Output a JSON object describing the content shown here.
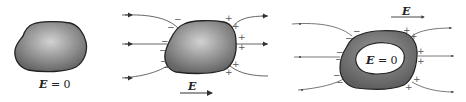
{
  "colors": {
    "conductor_fill_center": "#c8c8c8",
    "conductor_fill_edge": "#6a6a6a",
    "outline": "#222222",
    "field_line": "#555555",
    "cavity": "#ffffff"
  },
  "panels": [
    {
      "id": "isolated-conductor",
      "label_symbol": "E",
      "label_rest": " = 0"
    },
    {
      "id": "conductor-in-field",
      "field_label": "E",
      "negative_sign": "−",
      "positive_sign": "+"
    },
    {
      "id": "hollow-conductor-in-field",
      "field_label": "E",
      "cavity_label_symbol": "E",
      "cavity_label_rest": " = 0",
      "negative_sign": "−",
      "positive_sign": "+"
    }
  ]
}
